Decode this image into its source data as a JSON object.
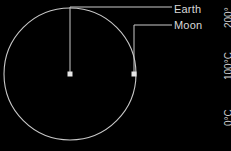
{
  "figure": {
    "background_color": "#000000",
    "stroke_color": "#c8c8c8",
    "text_color": "#d8d8d8",
    "width": 231,
    "height": 151
  },
  "callouts": [
    {
      "id": "earth",
      "label": "Earth",
      "marker": "square-dot",
      "marker_x": 70,
      "marker_y": 74,
      "leader_corner_x": 70,
      "leader_corner_y": 7,
      "leader_end_x": 172,
      "leader_end_y": 7
    },
    {
      "id": "moon",
      "label": "Moon",
      "marker": "square-dot",
      "marker_x": 134,
      "marker_y": 74,
      "leader_corner_x": 134,
      "leader_corner_y": 25,
      "leader_end_x": 172,
      "leader_end_y": 25
    }
  ],
  "orbit": {
    "name": "moon-orbit-circle",
    "center_x": 70,
    "center_y": 74,
    "radius": 66
  },
  "temperature_scale": {
    "orientation": "vertical",
    "labels": [
      {
        "id": "temp-200",
        "text": "200°"
      },
      {
        "id": "temp-100",
        "text": "100°C"
      },
      {
        "id": "temp-0",
        "text": "0°C"
      }
    ]
  }
}
